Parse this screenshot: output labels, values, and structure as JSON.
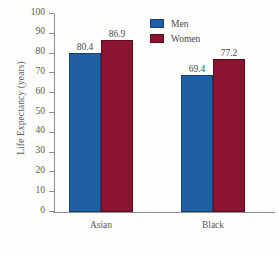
{
  "chart_data": {
    "type": "bar",
    "title": "",
    "xlabel": "",
    "ylabel": "Life Expectancy (years)",
    "categories": [
      "Asian",
      "Black"
    ],
    "series": [
      {
        "name": "Men",
        "color": "#1f5fa3",
        "values": [
          80.4,
          69.4
        ]
      },
      {
        "name": "Women",
        "color": "#8b1530",
        "values": [
          86.9,
          77.2
        ]
      }
    ],
    "ylim": [
      0,
      100
    ],
    "yticks": [
      0,
      10,
      20,
      30,
      40,
      50,
      60,
      70,
      80,
      90,
      100
    ],
    "ytick_labels": [
      "0",
      "10",
      "20",
      "30",
      "40",
      "50",
      "60",
      "70",
      "80",
      "90",
      "100"
    ],
    "value_labels": [
      "80.4",
      "86.9",
      "69.4",
      "77.2"
    ],
    "grid": false,
    "legend_position": "top-right"
  },
  "legend": {
    "items": [
      {
        "label": "Men",
        "color": "#1f5fa3"
      },
      {
        "label": "Women",
        "color": "#8b1530"
      }
    ]
  },
  "axis": {
    "y_title": "Life Expectancy (years)"
  }
}
